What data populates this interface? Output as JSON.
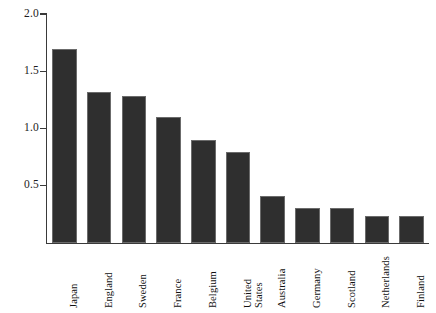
{
  "chart_data": {
    "type": "bar",
    "title": "",
    "subtitle": "",
    "xlabel": "",
    "ylabel": "",
    "categories": [
      "Japan",
      "England",
      "Sweden",
      "France",
      "Belgium",
      "United\nStates",
      "Australia",
      "Germany",
      "Scotland",
      "Netherlands",
      "Finland"
    ],
    "values": [
      1.7,
      1.32,
      1.29,
      1.1,
      0.9,
      0.8,
      0.41,
      0.31,
      0.31,
      0.24,
      0.24
    ],
    "ylim": [
      0,
      2.0
    ],
    "yticks": [
      0.5,
      1.0,
      1.5,
      2.0
    ],
    "ytick_labels": [
      "0.5",
      "1.0",
      "1.5",
      "2.0"
    ],
    "grid": false,
    "legend": null,
    "bar_color": "#2f2f2f",
    "bar_edge_color": "#6b6b6b",
    "axis_color": "#3a3a3a",
    "background": "#ffffff"
  },
  "axis": {
    "y_tick_0": "0.5",
    "y_tick_1": "1.0",
    "y_tick_2": "1.5",
    "y_tick_3": "2.0"
  }
}
